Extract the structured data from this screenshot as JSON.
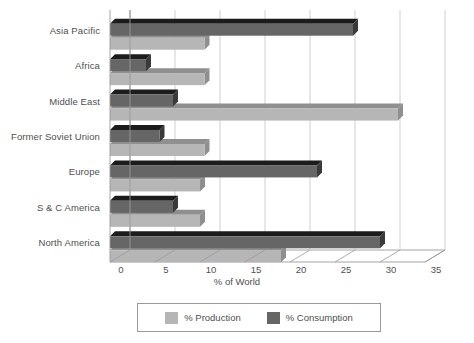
{
  "chart_data": {
    "type": "bar",
    "orientation": "horizontal",
    "title": "",
    "xlabel": "% of World",
    "ylabel": "",
    "xlim": [
      0,
      35
    ],
    "xticks": [
      0,
      5,
      10,
      15,
      20,
      25,
      30,
      35
    ],
    "xtick_labels": [
      "0",
      "5",
      "10",
      "15",
      "20",
      "25",
      "30",
      "35"
    ],
    "grid": true,
    "grid_axis": "x",
    "legend_position": "bottom",
    "categories": [
      "Asia Pacific",
      "Africa",
      "Middle East",
      "Former Soviet Union",
      "Europe",
      "S & C America",
      "North America"
    ],
    "series": [
      {
        "name": "% Production",
        "color": "#b6b6b6",
        "values": [
          10.5,
          10.5,
          32.0,
          10.5,
          10.0,
          10.0,
          19.0
        ]
      },
      {
        "name": "% Consumption",
        "color": "#666666",
        "values": [
          27.0,
          4.0,
          7.0,
          5.5,
          23.0,
          7.0,
          30.0
        ]
      }
    ]
  },
  "legend": {
    "items": [
      {
        "label": "% Production",
        "color": "#b6b6b6"
      },
      {
        "label": "% Consumption",
        "color": "#666666"
      }
    ]
  },
  "colors": {
    "production": "#b6b6b6",
    "production_top": "#8f8f8f",
    "production_side": "#8f8f8f",
    "consumption": "#666666",
    "consumption_top": "#1c1c1c",
    "consumption_side": "#3a3a3a",
    "grid": "#c9c9c9",
    "axis": "#9a9a9a",
    "text": "#4f4f4f",
    "background": "#ffffff"
  }
}
